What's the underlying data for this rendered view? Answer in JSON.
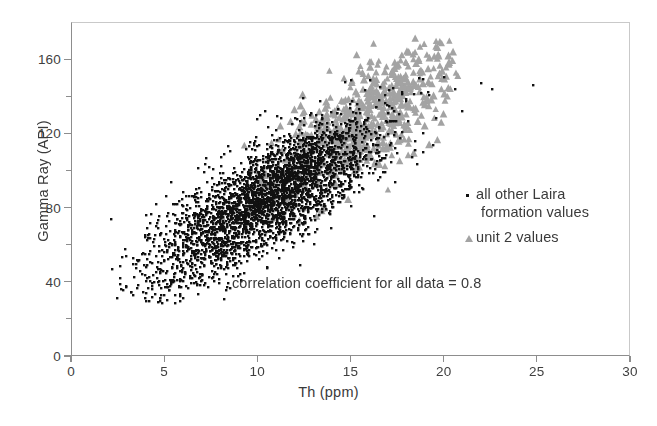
{
  "chart_data": {
    "type": "scatter",
    "title": "",
    "xlabel": "Th (ppm)",
    "ylabel": "Gamma Ray (API)",
    "xlim": [
      0,
      30
    ],
    "ylim": [
      0,
      180
    ],
    "xticks": [
      0,
      5,
      10,
      15,
      20,
      25,
      30
    ],
    "xticklabels": [
      "0",
      "5",
      "10",
      "15",
      "20",
      "25",
      "30"
    ],
    "yticks": [
      0,
      20,
      40,
      60,
      80,
      100,
      120,
      140,
      160
    ],
    "yticklabels_major": [
      "0",
      "40",
      "80",
      "120",
      "160"
    ],
    "ymajor": [
      0,
      40,
      80,
      120,
      160
    ],
    "yminor": [
      20,
      60,
      100,
      140
    ],
    "grid": false,
    "legend_position": "center-right",
    "annotation": "correlation coefficient for all data = 0.8",
    "correlation_coefficient": 0.8,
    "colors": {
      "series_1_marker": "#111111",
      "series_2_marker": "#a3a3a3",
      "axis": "#8d8d8d",
      "text": "#3a3a3a",
      "background": "#ffffff"
    },
    "series": [
      {
        "name": "all other Laira formation values",
        "name_line_1": "all other Laira",
        "name_line_2": "formation values",
        "marker": "square-dot",
        "color": "#111111",
        "n_points": 3400,
        "x_range": [
          2.0,
          24.8
        ],
        "y_range": [
          28,
          152
        ],
        "x_mean": 10.6,
        "y_mean": 86,
        "x_sd": 3.1,
        "y_sd": 23,
        "correlation": 0.8
      },
      {
        "name": "unit 2 values",
        "marker": "triangle",
        "color": "#a3a3a3",
        "n_points": 620,
        "x_range": [
          6.5,
          21.0
        ],
        "y_range": [
          60,
          172
        ],
        "x_mean": 15.8,
        "y_mean": 128,
        "x_sd": 2.6,
        "y_sd": 21,
        "correlation": 0.76
      }
    ],
    "outliers": [
      {
        "x": 22.0,
        "y": 147,
        "series": "all other Laira formation values"
      },
      {
        "x": 22.6,
        "y": 144,
        "series": "all other Laira formation values"
      },
      {
        "x": 24.8,
        "y": 146,
        "series": "all other Laira formation values"
      },
      {
        "x": 20.6,
        "y": 144,
        "series": "all other Laira formation values"
      },
      {
        "x": 21.0,
        "y": 132,
        "series": "all other Laira formation values"
      },
      {
        "x": 19.6,
        "y": 128,
        "series": "all other Laira formation values"
      },
      {
        "x": 5.1,
        "y": 86,
        "series": "all other Laira formation values"
      },
      {
        "x": 4.0,
        "y": 76,
        "series": "all other Laira formation values"
      }
    ]
  }
}
